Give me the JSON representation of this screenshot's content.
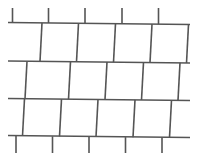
{
  "figure": {
    "name": "running-bond-shingle-pattern",
    "background_color": "#ffffff",
    "stroke_color": "#555555",
    "stroke_width": 1.6,
    "canvas": {
      "width": 199,
      "height": 162
    }
  },
  "geometry": {
    "course_lines": [
      {
        "id": "course-line-1",
        "label": "Top course line",
        "x1": 8,
        "y1": 22.5,
        "x2": 190,
        "y2": 24.5
      },
      {
        "id": "course-line-2",
        "label": "Second course line",
        "x1": 8,
        "y1": 61.0,
        "x2": 190,
        "y2": 63.0
      },
      {
        "id": "course-line-3",
        "label": "Third course line",
        "x1": 8,
        "y1": 98.5,
        "x2": 190,
        "y2": 100.5
      },
      {
        "id": "course-line-4",
        "label": "Bottom course line",
        "x1": 8,
        "y1": 135.5,
        "x2": 190,
        "y2": 137.5
      }
    ],
    "top_stubs": [
      {
        "id": "top-stub-1",
        "x1": 12.5,
        "y1": 8.0,
        "x2": 12.5,
        "y2": 22.6
      },
      {
        "id": "top-stub-2",
        "x1": 48.5,
        "y1": 8.0,
        "x2": 48.5,
        "y2": 23.0
      },
      {
        "id": "top-stub-3",
        "x1": 85.0,
        "y1": 8.0,
        "x2": 85.0,
        "y2": 23.4
      },
      {
        "id": "top-stub-4",
        "x1": 122.0,
        "y1": 8.0,
        "x2": 122.0,
        "y2": 23.8
      },
      {
        "id": "top-stub-5",
        "x1": 158.5,
        "y1": 8.0,
        "x2": 158.5,
        "y2": 24.2
      }
    ],
    "row1_joints": [
      {
        "id": "row1-joint-1",
        "x1": 42.0,
        "y1": 22.9,
        "x2": 40.0,
        "y2": 61.4
      },
      {
        "id": "row1-joint-2",
        "x1": 78.5,
        "y1": 23.3,
        "x2": 76.5,
        "y2": 61.8
      },
      {
        "id": "row1-joint-3",
        "x1": 115.5,
        "y1": 23.7,
        "x2": 113.5,
        "y2": 62.2
      },
      {
        "id": "row1-joint-4",
        "x1": 152.0,
        "y1": 24.1,
        "x2": 150.0,
        "y2": 62.6
      },
      {
        "id": "row1-joint-5",
        "x1": 188.5,
        "y1": 24.5,
        "x2": 186.5,
        "y2": 63.0
      }
    ],
    "row2_joints": [
      {
        "id": "row2-joint-1",
        "x1": 27.0,
        "y1": 61.2,
        "x2": 25.0,
        "y2": 98.8
      },
      {
        "id": "row2-joint-2",
        "x1": 70.5,
        "y1": 61.6,
        "x2": 68.5,
        "y2": 99.2
      },
      {
        "id": "row2-joint-3",
        "x1": 107.0,
        "y1": 62.0,
        "x2": 105.0,
        "y2": 99.6
      },
      {
        "id": "row2-joint-4",
        "x1": 143.5,
        "y1": 62.4,
        "x2": 141.5,
        "y2": 100.0
      },
      {
        "id": "row2-joint-5",
        "x1": 180.0,
        "y1": 62.8,
        "x2": 178.0,
        "y2": 100.4
      }
    ],
    "row3_joints": [
      {
        "id": "row3-joint-1",
        "x1": 24.5,
        "y1": 98.7,
        "x2": 22.5,
        "y2": 136.0
      },
      {
        "id": "row3-joint-2",
        "x1": 61.5,
        "y1": 99.1,
        "x2": 59.5,
        "y2": 136.4
      },
      {
        "id": "row3-joint-3",
        "x1": 98.0,
        "y1": 99.5,
        "x2": 96.0,
        "y2": 136.8
      },
      {
        "id": "row3-joint-4",
        "x1": 135.0,
        "y1": 99.9,
        "x2": 133.0,
        "y2": 137.2
      },
      {
        "id": "row3-joint-5",
        "x1": 171.5,
        "y1": 100.3,
        "x2": 169.5,
        "y2": 137.6
      }
    ],
    "bottom_stubs": [
      {
        "id": "bottom-stub-1",
        "x1": 16.0,
        "y1": 135.9,
        "x2": 16.0,
        "y2": 153.0
      },
      {
        "id": "bottom-stub-2",
        "x1": 52.5,
        "y1": 136.3,
        "x2": 52.5,
        "y2": 153.0
      },
      {
        "id": "bottom-stub-3",
        "x1": 89.0,
        "y1": 136.7,
        "x2": 89.0,
        "y2": 153.0
      },
      {
        "id": "bottom-stub-4",
        "x1": 125.5,
        "y1": 137.1,
        "x2": 125.5,
        "y2": 153.0
      },
      {
        "id": "bottom-stub-5",
        "x1": 162.0,
        "y1": 137.5,
        "x2": 162.0,
        "y2": 153.0
      }
    ]
  },
  "chart_data": {
    "type": "diagram",
    "rows": 3,
    "course_line_count": 4,
    "joints_per_row": 5,
    "top_stub_count": 5,
    "bottom_stub_count": 5,
    "unit_width_px": 36.6,
    "row_heights_px": [
      38.5,
      37.5,
      37.0
    ],
    "offset_per_row_px": [
      0,
      -15,
      -2.5
    ]
  }
}
